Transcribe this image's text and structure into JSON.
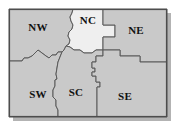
{
  "figure": {
    "type": "choropleth-region-map",
    "background_color": "#ffffff",
    "frame_color": "#4d4d4d",
    "shadow_color": "#b3b3b3",
    "boundary_color": "#5a5a5a",
    "fill_default": "#c9c9c9",
    "fill_highlight": "#efefef",
    "label_color": "#111111"
  },
  "map": {
    "regions": [
      {
        "id": "nw",
        "label": "NW",
        "fill": "#c9c9c9",
        "label_x": 38,
        "label_y": 28
      },
      {
        "id": "nc",
        "label": "NC",
        "fill": "#efefef",
        "label_x": 88,
        "label_y": 21
      },
      {
        "id": "ne",
        "label": "NE",
        "fill": "#c9c9c9",
        "label_x": 136,
        "label_y": 31
      },
      {
        "id": "sw",
        "label": "SW",
        "fill": "#c9c9c9",
        "label_x": 38,
        "label_y": 95
      },
      {
        "id": "sc",
        "label": "SC",
        "fill": "#c9c9c9",
        "label_x": 76,
        "label_y": 93
      },
      {
        "id": "se",
        "label": "SE",
        "fill": "#c9c9c9",
        "label_x": 125,
        "label_y": 97
      }
    ],
    "frame": {
      "x": 9,
      "y": 9,
      "width": 158,
      "height": 108
    }
  }
}
